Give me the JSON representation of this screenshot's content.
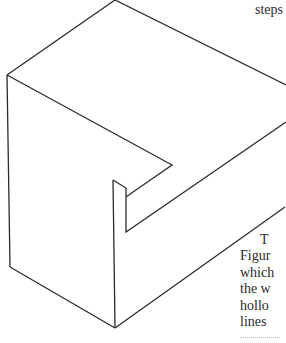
{
  "document": {
    "top_fragment": "steps",
    "paragraph_lines": [
      "T",
      "Figur",
      "which",
      "the w",
      "hollo",
      "lines"
    ]
  },
  "figure": {
    "stroke_color": "#2b2b2b"
  }
}
